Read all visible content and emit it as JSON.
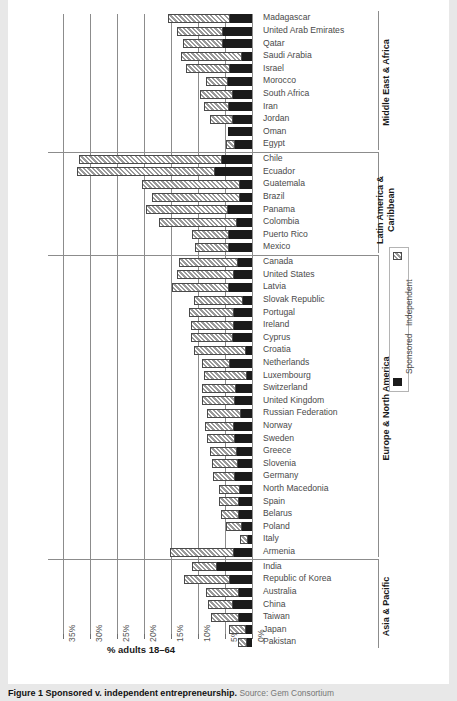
{
  "figure": {
    "caption_bold": "Figure 1",
    "caption_main": "Sponsored v. independent entrepreneurship.",
    "caption_source": "Source: Gem Consortium"
  },
  "legend": {
    "independent_label": "Independent",
    "sponsored_label": "Sponsored",
    "independent_color": "#c2c2c2",
    "sponsored_color": "#1b1b1b"
  },
  "axis": {
    "xlabel": "% adults 18–64",
    "ticks": [
      "35%",
      "30%",
      "25%",
      "20%",
      "15%",
      "10%",
      "5%",
      "0%"
    ]
  },
  "groups": [
    {
      "name": "Middle East & Africa",
      "label_lines": [
        "Middle East & Africa"
      ]
    },
    {
      "name": "Latin America & Caribbean",
      "label_lines": [
        "Latin America &",
        "Caribbean"
      ]
    },
    {
      "name": "Europe & North America",
      "label_lines": [
        "Europe & North America"
      ]
    },
    {
      "name": "Asia & Pacific",
      "label_lines": [
        "Asia & Pacific"
      ]
    }
  ],
  "chart_data": {
    "type": "bar",
    "orientation": "horizontal",
    "stacked": true,
    "title": "Sponsored v. independent entrepreneurship",
    "xlabel": "% adults 18–64",
    "ylabel": "",
    "xlim": [
      0,
      35
    ],
    "x_axis_reversed": true,
    "grid": true,
    "legend_position": "right",
    "xticks": [
      35,
      30,
      25,
      20,
      15,
      10,
      5,
      0
    ],
    "series": [
      {
        "name": "Independent",
        "pattern": "diagonal-hatch",
        "color": "#c2c2c2"
      },
      {
        "name": "Sponsored",
        "pattern": "solid",
        "color": "#1b1b1b"
      }
    ],
    "groups": [
      {
        "name": "Middle East & Africa",
        "categories": [
          "Madagascar",
          "United Arab Emirates",
          "Qatar",
          "Saudi Arabia",
          "Israel",
          "Morocco",
          "South Africa",
          "Iran",
          "Jordan",
          "Oman",
          "Egypt"
        ],
        "independent": [
          11.6,
          8.6,
          7.5,
          11.3,
          8.2,
          4.0,
          6.1,
          4.6,
          4.1,
          0.0,
          1.6
        ],
        "sponsored": [
          4.0,
          5.3,
          5.3,
          1.8,
          4.1,
          4.5,
          3.5,
          4.3,
          3.6,
          4.4,
          3.2
        ]
      },
      {
        "name": "Latin America & Caribbean",
        "categories": [
          "Chile",
          "Ecuador",
          "Guatemala",
          "Brazil",
          "Panama",
          "Colombia",
          "Puerto Rico",
          "Mexico"
        ],
        "independent": [
          26.6,
          25.6,
          18.0,
          16.4,
          15.2,
          14.5,
          6.8,
          6.4
        ],
        "sponsored": [
          5.5,
          6.9,
          2.3,
          2.2,
          4.5,
          2.8,
          4.3,
          4.2
        ]
      },
      {
        "name": "Europe & North America",
        "categories": [
          "Canada",
          "United States",
          "Latvia",
          "Slovak Republic",
          "Portugal",
          "Ireland",
          "Cyprus",
          "Croatia",
          "Netherlands",
          "Luxembourg",
          "Switzerland",
          "United Kingdom",
          "Russian Federation",
          "Norway",
          "Sweden",
          "Greece",
          "Slovenia",
          "Germany",
          "North Macedonia",
          "Spain",
          "Belarus",
          "Poland",
          "Italy",
          "Armenia"
        ],
        "independent": [
          11.0,
          10.5,
          10.6,
          9.0,
          8.3,
          8.0,
          7.8,
          9.6,
          5.2,
          7.8,
          6.2,
          6.0,
          6.3,
          5.3,
          5.2,
          5.0,
          4.8,
          4.2,
          4.0,
          3.8,
          3.4,
          3.0,
          1.5,
          11.8
        ],
        "sponsored": [
          2.6,
          3.4,
          4.2,
          1.7,
          3.4,
          3.3,
          3.5,
          1.2,
          4.0,
          1.0,
          3.0,
          3.2,
          2.0,
          3.4,
          3.2,
          2.8,
          2.6,
          3.1,
          2.2,
          2.4,
          2.4,
          1.8,
          0.7,
          3.3
        ]
      },
      {
        "name": "Asia & Pacific",
        "categories": [
          "India",
          "Republic of Korea",
          "Australia",
          "China",
          "Taiwan",
          "Japan",
          "Pakistan"
        ],
        "independent": [
          4.8,
          8.6,
          6.2,
          4.5,
          5.2,
          3.0,
          1.6
        ],
        "sponsored": [
          6.4,
          4.0,
          2.4,
          3.6,
          2.4,
          1.2,
          1.0
        ]
      }
    ]
  }
}
